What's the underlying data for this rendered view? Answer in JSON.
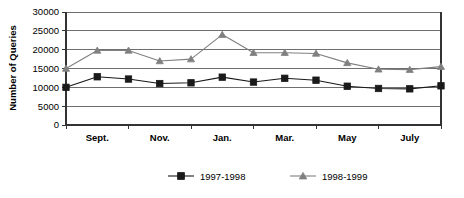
{
  "chart_data": {
    "type": "line",
    "title": "",
    "xlabel": "",
    "ylabel": "Number of Queries",
    "ylim": [
      0,
      30000
    ],
    "ytick_labels": [
      "0",
      "5000",
      "10000",
      "15000",
      "20000",
      "25000",
      "30000"
    ],
    "ytick_values": [
      0,
      5000,
      10000,
      15000,
      20000,
      25000,
      30000
    ],
    "grid": true,
    "legend_position": "bottom",
    "x": [
      "Aug.",
      "Sept.",
      "Oct.",
      "Nov.",
      "Dec.",
      "Jan.",
      "Feb.",
      "Mar.",
      "Apr.",
      "May",
      "June",
      "July",
      "Aug."
    ],
    "xtick_labels": [
      "Sept.",
      "Nov.",
      "Jan.",
      "Mar.",
      "May",
      "July"
    ],
    "series": [
      {
        "name": "1997-1998",
        "marker": "square",
        "color": "#1a1a1a",
        "values": [
          10000,
          12800,
          12200,
          11000,
          11200,
          12700,
          11400,
          12400,
          11900,
          10300,
          9700,
          9600,
          10400
        ]
      },
      {
        "name": "1998-1999",
        "marker": "triangle",
        "color": "#808080",
        "values": [
          15000,
          19800,
          19800,
          17000,
          17500,
          24000,
          19200,
          19200,
          19000,
          16500,
          14800,
          14700,
          15500
        ]
      }
    ]
  },
  "legend": {
    "items": [
      {
        "label": "1997-1998"
      },
      {
        "label": "1998-1999"
      }
    ]
  }
}
